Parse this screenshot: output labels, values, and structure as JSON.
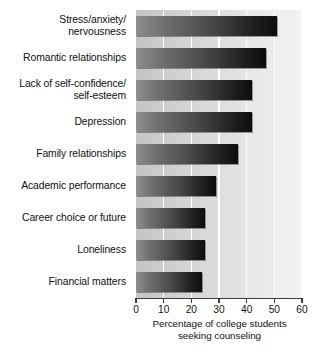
{
  "chart_data": {
    "type": "bar",
    "orientation": "horizontal",
    "title": "",
    "subtitle": "",
    "xlabel": "Percentage of college students\nseeking counseling",
    "ylabel": "",
    "xlim": [
      0,
      60
    ],
    "xticks": [
      0,
      10,
      20,
      30,
      40,
      50,
      60
    ],
    "xtick_labels": [
      "0",
      "10",
      "20",
      "30",
      "40",
      "50",
      "60"
    ],
    "grid": "vertical-white-gridlines",
    "legend": "none",
    "categories": [
      "Stress/anxiety/\nnervousness",
      "Romantic relationships",
      "Lack of self-confidence/\nself-esteem",
      "Depression",
      "Family relationships",
      "Academic performance",
      "Career choice or future",
      "Loneliness",
      "Financial matters"
    ],
    "values": [
      51,
      47,
      42,
      42,
      37,
      29,
      25,
      25,
      24
    ],
    "bar_fill": "gradient-gray-to-black",
    "plot_background": "gradient-gray-light-right",
    "colors": {
      "bar_start": "#8e8e8e",
      "bar_end": "#0d0d0d",
      "plot_bg_start": "#c4c4c4",
      "plot_bg_end": "#f2f2f2",
      "gridline": "#ffffff",
      "axis": "#3b3b3b",
      "text": "#111111"
    }
  }
}
